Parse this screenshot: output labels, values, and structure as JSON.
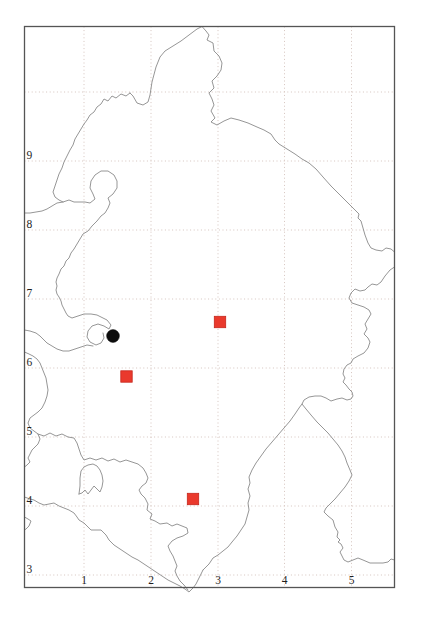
{
  "page": {
    "background": "#ffffff"
  },
  "map": {
    "frame": {
      "x": 24.5,
      "y": 26.5,
      "width": 370,
      "height": 561,
      "stroke": "#555555"
    },
    "grid": {
      "color": "#d5c4be",
      "dash": "1 2.6"
    },
    "boundary_color": "#8a8a8a",
    "label_color": "#1f1f1f",
    "x_ticks": [
      {
        "label": "1",
        "px": 84
      },
      {
        "label": "2",
        "px": 151
      },
      {
        "label": "3",
        "px": 218
      },
      {
        "label": "4",
        "px": 284.5
      },
      {
        "label": "5",
        "px": 351.5
      }
    ],
    "y_ticks": [
      {
        "label": "",
        "px": 92
      },
      {
        "label": "9",
        "px": 161
      },
      {
        "label": "8",
        "px": 230
      },
      {
        "label": "7",
        "px": 299
      },
      {
        "label": "6",
        "px": 368
      },
      {
        "label": "5",
        "px": 437
      },
      {
        "label": "4",
        "px": 506
      },
      {
        "label": "3",
        "px": 575
      }
    ],
    "markers": [
      {
        "type": "circle",
        "color": "#0d0d0d",
        "stroke": "#0d0d0d",
        "px": {
          "x": 113,
          "y": 336
        },
        "map": {
          "x": 1.43,
          "y": 6.46
        },
        "diameter": 12.8
      },
      {
        "type": "square",
        "color": "#ea392c",
        "stroke": "#c5271d",
        "px": {
          "x": 220,
          "y": 322
        },
        "map": {
          "x": 3.03,
          "y": 6.67
        },
        "size": 11.4
      },
      {
        "type": "square",
        "color": "#ea392c",
        "stroke": "#c5271d",
        "px": {
          "x": 126.5,
          "y": 376.5
        },
        "map": {
          "x": 1.63,
          "y": 5.88
        },
        "size": 11.4
      },
      {
        "type": "square",
        "color": "#ea392c",
        "stroke": "#c5271d",
        "px": {
          "x": 193,
          "y": 499
        },
        "map": {
          "x": 2.63,
          "y": 4.1
        },
        "size": 11.4
      }
    ]
  },
  "chart_data": {
    "type": "scatter",
    "title": "",
    "xlabel": "",
    "ylabel": "",
    "x_ticks": [
      1,
      2,
      3,
      4,
      5
    ],
    "y_ticks": [
      3,
      4,
      5,
      6,
      7,
      8,
      9
    ],
    "xlim": [
      0.1,
      5.65
    ],
    "ylim": [
      2.82,
      10
    ],
    "grid": true,
    "legend": false,
    "series": [
      {
        "name": "black-circle-record",
        "marker": "circle",
        "color": "#0d0d0d",
        "points": [
          {
            "x": 1.43,
            "y": 6.46
          }
        ]
      },
      {
        "name": "red-square-records",
        "marker": "square",
        "color": "#ea392c",
        "points": [
          {
            "x": 3.03,
            "y": 6.67
          },
          {
            "x": 1.63,
            "y": 5.88
          },
          {
            "x": 2.63,
            "y": 4.1
          }
        ]
      }
    ]
  }
}
